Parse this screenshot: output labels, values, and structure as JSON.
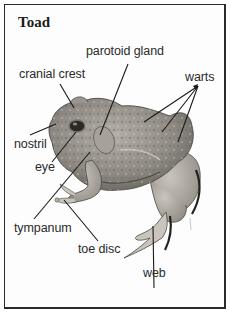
{
  "figure": {
    "title": "Toad",
    "labels": {
      "parotoid_gland": "parotoid gland",
      "cranial_crest": "cranial crest",
      "warts": "warts",
      "nostril": "nostril",
      "eye": "eye",
      "tympanum": "tympanum",
      "toe_disc": "toe disc",
      "web": "web"
    }
  },
  "colors": {
    "border": "#2a2a2a",
    "label_text": "#2a2a2a",
    "leader_lines": "#1a1a1a",
    "toad_body": "#8d8a84",
    "toad_shadow": "#5e5b56"
  }
}
